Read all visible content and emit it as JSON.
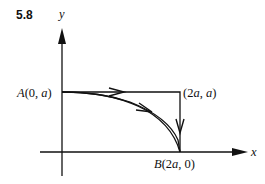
{
  "figure": {
    "number": "5.8",
    "axes": {
      "x_label": "x",
      "y_label": "y"
    },
    "points": {
      "A": {
        "name": "A",
        "coords": "(0, a)",
        "coord_open": "(0, ",
        "coord_var": "a",
        "coord_close": ")"
      },
      "corner": {
        "coords": "(2a, a)",
        "p1": "(2",
        "v1": "a",
        "sep": ", ",
        "v2": "a",
        "close": ")"
      },
      "B": {
        "name": "B",
        "coords": "(2a, 0)",
        "p1": "(2",
        "v1": "a",
        "rest": ", 0)"
      }
    },
    "paths": [
      {
        "name": "rectangular-path",
        "description": "A to (2a, a) horizontally, then down to B"
      },
      {
        "name": "curved-path",
        "description": "Curve from A to B"
      }
    ],
    "colors": {
      "stroke": "#111111",
      "background": "#ffffff"
    }
  }
}
